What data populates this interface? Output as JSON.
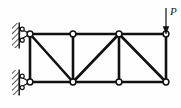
{
  "figure": {
    "kind": "structural-truss-diagram",
    "title": "",
    "background_color": "#fefefe",
    "line_color": "#111111",
    "node_fill_color": "#ffffff",
    "hatch_color": "#2b2b2b"
  },
  "load": {
    "label": "P",
    "direction": "down",
    "arrow": {
      "x": 166,
      "y_start": 8,
      "y_end": 33
    },
    "label_position": {
      "x": 171,
      "y": 8
    }
  },
  "geometry": {
    "top_chord_y": 34,
    "bottom_chord_y": 82,
    "panel_x": [
      30,
      73,
      119,
      166
    ],
    "nodes": [
      {
        "id": "A",
        "x": 30,
        "y": 34,
        "name": "top-left-node"
      },
      {
        "id": "B",
        "x": 73,
        "y": 34,
        "name": "top-mid-left-node"
      },
      {
        "id": "C",
        "x": 119,
        "y": 34,
        "name": "top-mid-right-node"
      },
      {
        "id": "D",
        "x": 166,
        "y": 34,
        "name": "top-right-node"
      },
      {
        "id": "E",
        "x": 30,
        "y": 82,
        "name": "bottom-left-node"
      },
      {
        "id": "F",
        "x": 73,
        "y": 82,
        "name": "bottom-mid-left-node"
      },
      {
        "id": "G",
        "x": 119,
        "y": 82,
        "name": "bottom-mid-right-node"
      },
      {
        "id": "H",
        "x": 166,
        "y": 82,
        "name": "bottom-right-node"
      }
    ],
    "members": [
      {
        "from": "A",
        "to": "B",
        "type": "top-chord"
      },
      {
        "from": "B",
        "to": "C",
        "type": "top-chord"
      },
      {
        "from": "C",
        "to": "D",
        "type": "top-chord"
      },
      {
        "from": "E",
        "to": "F",
        "type": "bottom-chord"
      },
      {
        "from": "F",
        "to": "G",
        "type": "bottom-chord"
      },
      {
        "from": "G",
        "to": "H",
        "type": "bottom-chord"
      },
      {
        "from": "A",
        "to": "E",
        "type": "vertical"
      },
      {
        "from": "B",
        "to": "F",
        "type": "vertical"
      },
      {
        "from": "C",
        "to": "G",
        "type": "vertical"
      },
      {
        "from": "D",
        "to": "H",
        "type": "vertical"
      },
      {
        "from": "A",
        "to": "F",
        "type": "diagonal"
      },
      {
        "from": "C",
        "to": "F",
        "type": "diagonal"
      },
      {
        "from": "C",
        "to": "H",
        "type": "diagonal"
      }
    ]
  },
  "supports": [
    {
      "id": "upper-support",
      "kind": "pin-support",
      "node": "A",
      "wall": {
        "x": 12,
        "y": 23,
        "width": 7,
        "height": 25
      },
      "triangle": {
        "apex_x": 19,
        "apex_y": 35,
        "tip_x": 30,
        "tip_y": 34
      },
      "rollers": [
        {
          "cx": 22,
          "cy": 29
        },
        {
          "cx": 22,
          "cy": 41
        }
      ]
    },
    {
      "id": "lower-support",
      "kind": "pin-support",
      "node": "E",
      "wall": {
        "x": 12,
        "y": 70,
        "width": 7,
        "height": 25
      },
      "triangle": {
        "apex_x": 19,
        "apex_y": 83,
        "tip_x": 30,
        "tip_y": 82
      },
      "rollers": [
        {
          "cx": 22,
          "cy": 76
        },
        {
          "cx": 22,
          "cy": 88
        }
      ]
    }
  ]
}
